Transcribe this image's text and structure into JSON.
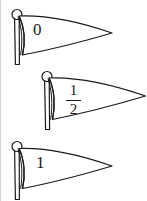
{
  "figure": {
    "background_color": "#ffffff",
    "ink_color": "#1a1a1a",
    "stroke_width": 1.2,
    "width": 147,
    "height": 201
  },
  "flags": [
    {
      "id": "flag-zero",
      "label": "0",
      "label_kind": "integer",
      "pole_x": 17,
      "pole_top_y": 14,
      "pole_bottom_y": 65,
      "finial_radius": 5,
      "flag_top_y": 15,
      "flag_bottom_y": 55,
      "tip_x": 112,
      "tip_y": 33
    },
    {
      "id": "flag-one-half",
      "label": "1/2",
      "label_kind": "fraction",
      "numerator": "1",
      "denominator": "2",
      "pole_x": 47,
      "pole_top_y": 76,
      "pole_bottom_y": 130,
      "finial_radius": 5,
      "flag_top_y": 77,
      "flag_bottom_y": 120,
      "tip_x": 145,
      "tip_y": 96
    },
    {
      "id": "flag-one",
      "label": "1",
      "label_kind": "integer",
      "pole_x": 17,
      "pole_top_y": 146,
      "pole_bottom_y": 199,
      "finial_radius": 5,
      "flag_top_y": 147,
      "flag_bottom_y": 189,
      "tip_x": 112,
      "tip_y": 166
    }
  ],
  "artifacts": {
    "left_edge_line": true,
    "left_edge_color": "#d8d8d8"
  }
}
